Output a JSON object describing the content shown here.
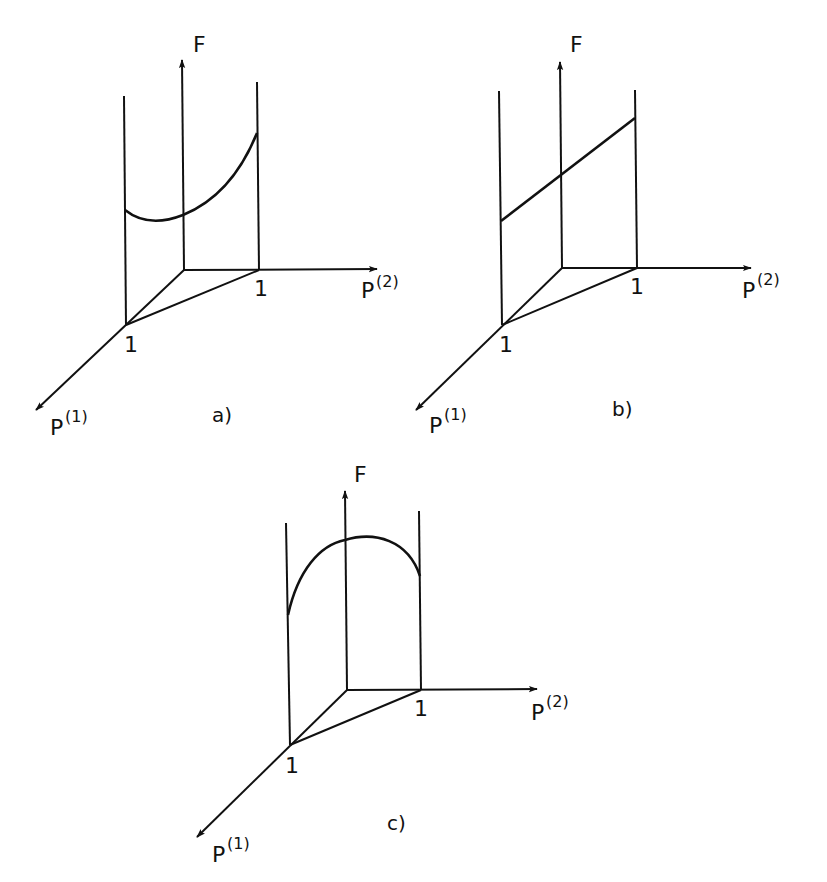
{
  "figure": {
    "panels": [
      {
        "id": "a",
        "caption": "a)",
        "axis_f": "F",
        "axis_p1": "P",
        "axis_p1_sup": "(1)",
        "axis_p2": "P",
        "axis_p2_sup": "(2)",
        "tick_p1": "1",
        "tick_p2": "1",
        "curve_shape": "convex (dips then rises)"
      },
      {
        "id": "b",
        "caption": "b)",
        "axis_f": "F",
        "axis_p1": "P",
        "axis_p1_sup": "(1)",
        "axis_p2": "P",
        "axis_p2_sup": "(2)",
        "tick_p1": "1",
        "tick_p2": "1",
        "curve_shape": "linear (rising)"
      },
      {
        "id": "c",
        "caption": "c)",
        "axis_f": "F",
        "axis_p1": "P",
        "axis_p1_sup": "(1)",
        "axis_p2": "P",
        "axis_p2_sup": "(2)",
        "tick_p1": "1",
        "tick_p2": "1",
        "curve_shape": "concave (rises then falls)"
      }
    ]
  }
}
